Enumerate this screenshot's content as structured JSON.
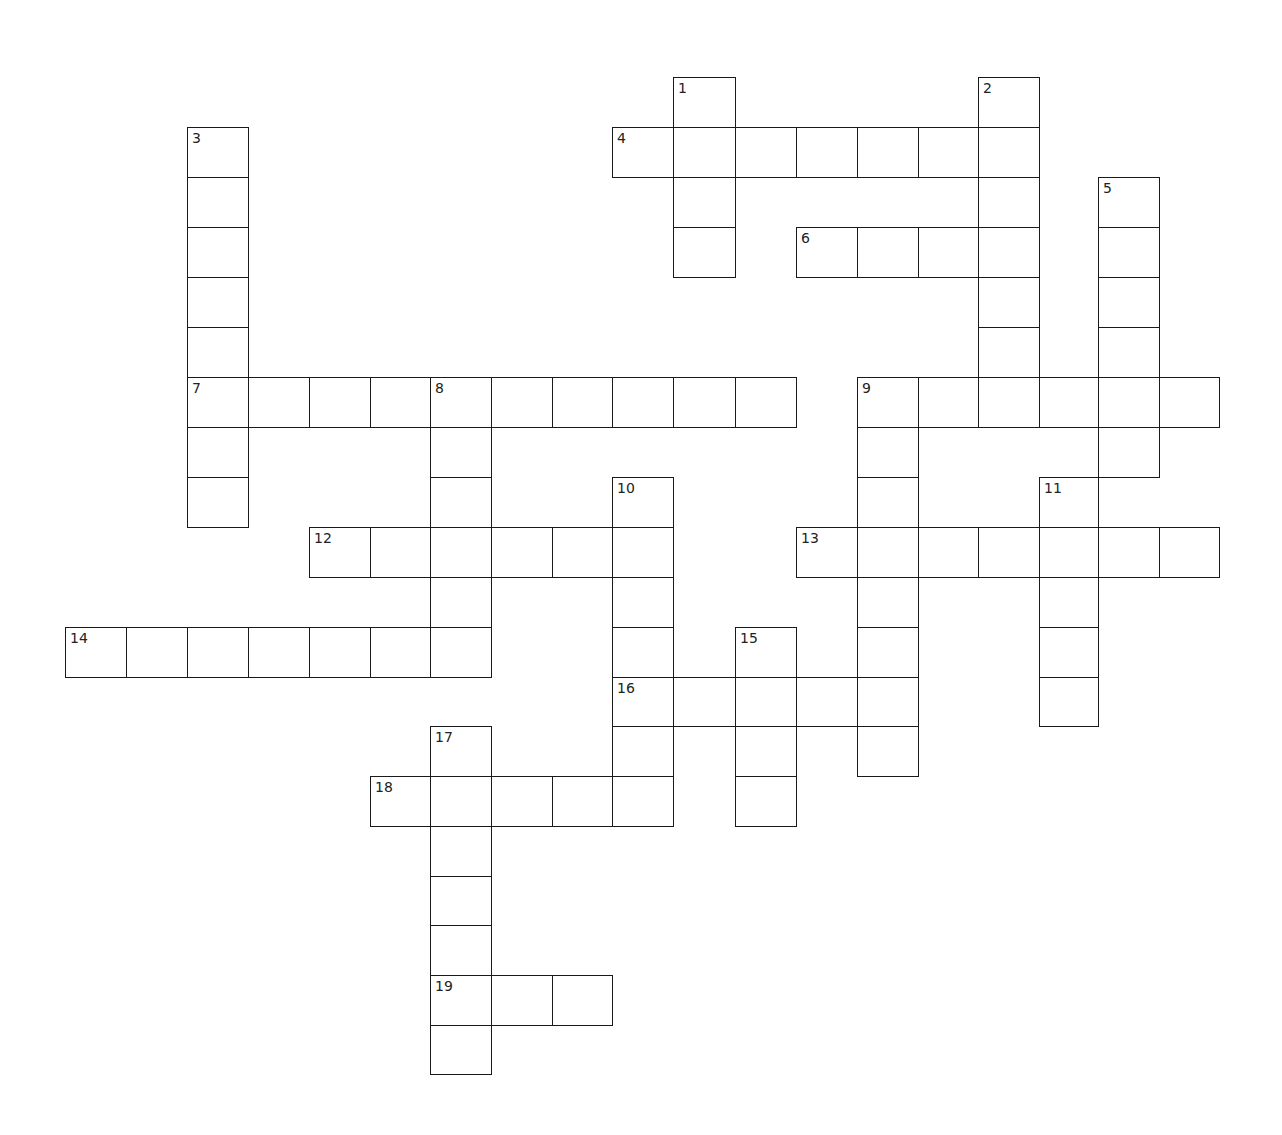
{
  "puzzle": {
    "type": "crossword",
    "grid": {
      "col_x": [
        65,
        126,
        187,
        248,
        309,
        370,
        430,
        491,
        552,
        612,
        673,
        735,
        796,
        857,
        918,
        978,
        1039,
        1098,
        1159,
        1219
      ],
      "row_y": [
        77,
        127,
        177,
        227,
        277,
        327,
        377,
        427,
        477,
        527,
        577,
        627,
        677,
        726,
        776,
        826,
        876,
        925,
        975,
        1025,
        1074
      ]
    },
    "entries": [
      {
        "number": "1",
        "direction": "down",
        "col": 10,
        "row": 0,
        "length": 4
      },
      {
        "number": "2",
        "direction": "down",
        "col": 15,
        "row": 0,
        "length": 7
      },
      {
        "number": "3",
        "direction": "down",
        "col": 2,
        "row": 1,
        "length": 8
      },
      {
        "number": "4",
        "direction": "across",
        "col": 9,
        "row": 1,
        "length": 7
      },
      {
        "number": "5",
        "direction": "down",
        "col": 17,
        "row": 2,
        "length": 6
      },
      {
        "number": "6",
        "direction": "across",
        "col": 12,
        "row": 3,
        "length": 4
      },
      {
        "number": "7",
        "direction": "across",
        "col": 2,
        "row": 6,
        "length": 10
      },
      {
        "number": "8",
        "direction": "down",
        "col": 6,
        "row": 6,
        "length": 6
      },
      {
        "number": "9",
        "direction": "across",
        "col": 13,
        "row": 6,
        "length": 6
      },
      {
        "number": "9",
        "direction": "down",
        "col": 13,
        "row": 6,
        "length": 8
      },
      {
        "number": "10",
        "direction": "down",
        "col": 9,
        "row": 8,
        "length": 7
      },
      {
        "number": "11",
        "direction": "down",
        "col": 16,
        "row": 8,
        "length": 5
      },
      {
        "number": "12",
        "direction": "across",
        "col": 4,
        "row": 9,
        "length": 6
      },
      {
        "number": "13",
        "direction": "across",
        "col": 12,
        "row": 9,
        "length": 7
      },
      {
        "number": "14",
        "direction": "across",
        "col": 0,
        "row": 11,
        "length": 7
      },
      {
        "number": "15",
        "direction": "down",
        "col": 11,
        "row": 11,
        "length": 4
      },
      {
        "number": "16",
        "direction": "across",
        "col": 9,
        "row": 12,
        "length": 5
      },
      {
        "number": "17",
        "direction": "down",
        "col": 6,
        "row": 13,
        "length": 7
      },
      {
        "number": "18",
        "direction": "across",
        "col": 5,
        "row": 14,
        "length": 5
      },
      {
        "number": "19",
        "direction": "across",
        "col": 6,
        "row": 18,
        "length": 3
      }
    ]
  }
}
